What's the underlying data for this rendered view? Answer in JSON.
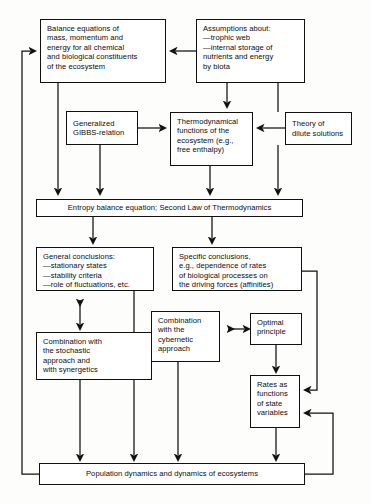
{
  "diagram": {
    "line_color": "#111111",
    "box_fill": "#ffffff",
    "background": "#fdfdfb",
    "nodes": {
      "balance_equations": "Balance equations of\nmass, momentum and\nenergy for all chemical\nand biological constituents\nof the ecosystem",
      "assumptions": "Assumptions about:\n—trophic web\n—internal storage of\n   nutrients and energy\n   by biota",
      "gibbs_relation": "Generalized\nGIBBS-relation",
      "thermodynamical_functions": "Thermodynamical\nfunctions of the\necosystem (e.g.,\nfree enthalpy)",
      "dilute_solutions": "Theory of\ndilute solutions",
      "entropy_balance": "Entropy balance equation; Second Law of Thermodynamics",
      "general_conclusions": "General conclusions:\n—stationary states\n—stability criteria\n—role of fluctuations, etc.",
      "specific_conclusions": "Specific conclusions,\ne.g., dependence of rates\nof biological processes on\nthe driving forces (affinities)",
      "stochastic_combination": "Combination with\nthe stochastic\napproach and\nwith synergetics",
      "cybernetic_combination": "Combination\nwith the\ncybernetic\napproach",
      "optimal_principle": "Optimal\nprinciple",
      "rates_state_variables": "Rates as\nfunctions\nof state\nvariables",
      "population_dynamics": "Population dynamics and dynamics of ecosystems"
    }
  }
}
